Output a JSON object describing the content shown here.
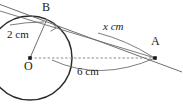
{
  "figure": {
    "background_color": "#ffffff",
    "stroke_color": "#2b2b2b",
    "light_stroke_color": "#6e6e6e",
    "text_color": "#1a1a1a",
    "points": [
      {
        "id": "O",
        "label": "O",
        "x": 30,
        "y": 58,
        "label_x": 24,
        "label_y": 62,
        "marker": "dot"
      },
      {
        "id": "B",
        "label": "B",
        "x": 47,
        "y": 19,
        "label_x": 42,
        "label_y": 2,
        "marker": "none"
      },
      {
        "id": "A",
        "label": "A",
        "x": 155,
        "y": 58,
        "label_x": 152,
        "label_y": 37,
        "marker": "dot"
      }
    ],
    "measurements": [
      {
        "id": "radius",
        "text": "2 cm",
        "x": 7,
        "y": 30,
        "style": "upright"
      },
      {
        "id": "tangent",
        "text": "x cm",
        "x": 103,
        "y": 22,
        "style": "italic"
      },
      {
        "id": "hypotenuse",
        "text": "6 cm",
        "x": 78,
        "y": 68,
        "style": "upright"
      }
    ],
    "circle": {
      "cx": 30,
      "cy": 58,
      "r": 42
    },
    "segments": [
      {
        "id": "radius-OB",
        "from": "O",
        "to": "B",
        "style": "solid-thin"
      },
      {
        "id": "tangent-line",
        "from": "B",
        "to": "A",
        "style": "solid-thin-extended"
      },
      {
        "id": "hypotenuse-OA",
        "from": "O",
        "to": "A",
        "style": "dashed"
      }
    ],
    "right_angle": {
      "at": "B",
      "size": 5,
      "shown": true
    }
  }
}
